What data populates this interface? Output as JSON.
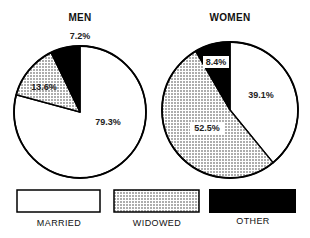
{
  "chart_data": [
    {
      "type": "pie",
      "title": "MEN",
      "categories": [
        "MARRIED",
        "WIDOWED",
        "OTHER"
      ],
      "values": [
        79.3,
        13.6,
        7.2
      ],
      "labels": [
        "79.3%",
        "13.6%",
        "7.2%"
      ],
      "start_angle_deg": 0,
      "direction": "clockwise_from_top",
      "legend_position": "bottom"
    },
    {
      "type": "pie",
      "title": "WOMEN",
      "categories": [
        "MARRIED",
        "WIDOWED",
        "OTHER"
      ],
      "values": [
        39.1,
        52.5,
        8.4
      ],
      "labels": [
        "39.1%",
        "52.5%",
        "8.4%"
      ],
      "start_angle_deg": 0,
      "direction": "clockwise_from_top",
      "legend_position": "bottom"
    }
  ],
  "legend": {
    "items": [
      {
        "label": "MARRIED",
        "fill": "#ffffff"
      },
      {
        "label": "WIDOWED",
        "fill": "dotted"
      },
      {
        "label": "OTHER",
        "fill": "#000000"
      }
    ]
  },
  "colors": {
    "stroke": "#000000",
    "married": "#ffffff",
    "widowed_bg": "#ffffff",
    "widowed_dot": "#333333",
    "other": "#000000"
  }
}
